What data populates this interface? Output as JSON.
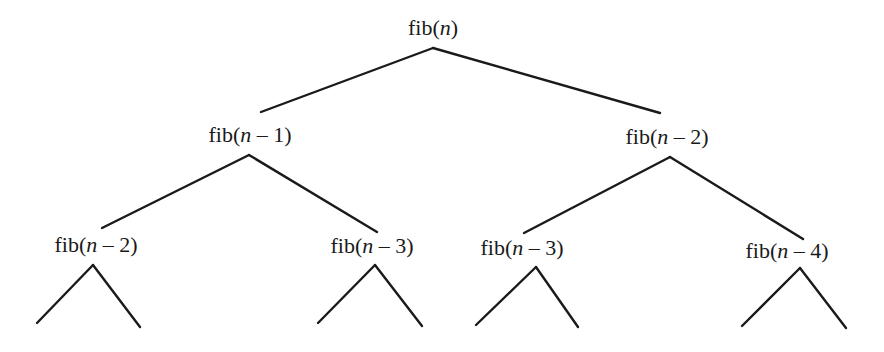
{
  "diagram": {
    "type": "recursion-tree",
    "colors": {
      "line": "#1a1a1a",
      "text": "#1a1a1a",
      "background": "#ffffff"
    },
    "nodes": [
      {
        "id": "root",
        "fn": "fib(",
        "var": "n",
        "rest": ")",
        "label": "fib(n)",
        "x": 433,
        "y": 17
      },
      {
        "id": "l",
        "fn": "fib(",
        "var": "n",
        "rest": " – 1)",
        "label": "fib(n – 1)",
        "x": 250,
        "y": 124
      },
      {
        "id": "r",
        "fn": "fib(",
        "var": "n",
        "rest": " – 2)",
        "label": "fib(n – 2)",
        "x": 667,
        "y": 126
      },
      {
        "id": "ll",
        "fn": "fib(",
        "var": "n",
        "rest": " – 2)",
        "label": "fib(n – 2)",
        "x": 96,
        "y": 234
      },
      {
        "id": "lr",
        "fn": "fib(",
        "var": "n",
        "rest": " – 3)",
        "label": "fib(n – 3)",
        "x": 372,
        "y": 235
      },
      {
        "id": "rl",
        "fn": "fib(",
        "var": "n",
        "rest": " – 3)",
        "label": "fib(n – 3)",
        "x": 522,
        "y": 237
      },
      {
        "id": "rr",
        "fn": "fib(",
        "var": "n",
        "rest": " – 4)",
        "label": "fib(n – 4)",
        "x": 787,
        "y": 240
      }
    ],
    "edges": [
      {
        "from": "root",
        "to": "l",
        "x1": 433,
        "y1": 48,
        "x2": 261,
        "y2": 112
      },
      {
        "from": "root",
        "to": "r",
        "x1": 433,
        "y1": 48,
        "x2": 660,
        "y2": 113
      },
      {
        "from": "l",
        "to": "ll",
        "x1": 249,
        "y1": 155,
        "x2": 102,
        "y2": 228
      },
      {
        "from": "l",
        "to": "lr",
        "x1": 249,
        "y1": 155,
        "x2": 377,
        "y2": 232
      },
      {
        "from": "r",
        "to": "rl",
        "x1": 670,
        "y1": 157,
        "x2": 524,
        "y2": 233
      },
      {
        "from": "r",
        "to": "rr",
        "x1": 670,
        "y1": 157,
        "x2": 803,
        "y2": 239
      }
    ],
    "subtrees": [
      {
        "under": "ll",
        "apex": [
          93,
          265
        ],
        "left": [
          37,
          323
        ],
        "right": [
          140,
          327
        ]
      },
      {
        "under": "lr",
        "apex": [
          375,
          265
        ],
        "left": [
          318,
          323
        ],
        "right": [
          422,
          326
        ]
      },
      {
        "under": "rl",
        "apex": [
          536,
          267
        ],
        "left": [
          476,
          325
        ],
        "right": [
          578,
          327
        ]
      },
      {
        "under": "rr",
        "apex": [
          800,
          268
        ],
        "left": [
          742,
          326
        ],
        "right": [
          846,
          328
        ]
      }
    ]
  }
}
